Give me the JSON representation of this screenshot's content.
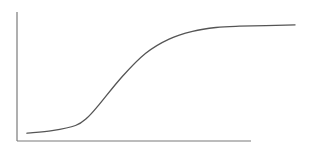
{
  "chart_data": {
    "type": "line",
    "title": "",
    "xlabel": "",
    "ylabel": "",
    "grid": false,
    "legend": null,
    "xlim": [
      0,
      10
    ],
    "ylim": [
      0,
      10
    ],
    "series": [
      {
        "name": "curve",
        "color": "#555555",
        "x": [
          0.4,
          1.5,
          2.5,
          3.0,
          3.5,
          4.5,
          5.5,
          6.5,
          7.5,
          8.5,
          9.5,
          11.9
        ],
        "y": [
          0.6,
          0.8,
          1.2,
          1.8,
          2.8,
          5.0,
          6.8,
          7.9,
          8.5,
          8.8,
          8.9,
          9.0
        ]
      }
    ]
  },
  "colors": {
    "axis": "#7a7a7a",
    "line": "#555555",
    "background": "#ffffff"
  }
}
